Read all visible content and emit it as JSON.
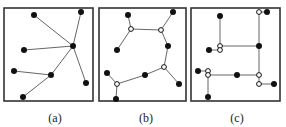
{
  "colors": {
    "stroke": "#555555",
    "border": "#333333",
    "node": "#111111",
    "background": "#ffffff"
  },
  "panels": [
    {
      "id": "a",
      "label": "(a)",
      "label_x": 55,
      "box": {
        "x": 4,
        "y": 8,
        "w": 89,
        "h": 93
      },
      "nodes": [
        {
          "x": 34,
          "y": 15,
          "type": "filled"
        },
        {
          "x": 81,
          "y": 12,
          "type": "filled"
        },
        {
          "x": 73,
          "y": 46,
          "type": "filled"
        },
        {
          "x": 24,
          "y": 50,
          "type": "filled"
        },
        {
          "x": 14,
          "y": 71,
          "type": "filled"
        },
        {
          "x": 51,
          "y": 75,
          "type": "filled"
        },
        {
          "x": 86,
          "y": 83,
          "type": "filled"
        },
        {
          "x": 23,
          "y": 97,
          "type": "filled"
        }
      ],
      "edges": [
        [
          0,
          2
        ],
        [
          1,
          2
        ],
        [
          3,
          2
        ],
        [
          5,
          2
        ],
        [
          6,
          2
        ],
        [
          4,
          5
        ],
        [
          7,
          5
        ]
      ]
    },
    {
      "id": "b",
      "label": "(b)",
      "label_x": 146,
      "box": {
        "x": 99,
        "y": 8,
        "w": 87,
        "h": 93
      },
      "nodes": [
        {
          "x": 128,
          "y": 15,
          "type": "filled"
        },
        {
          "x": 173,
          "y": 12,
          "type": "filled"
        },
        {
          "x": 131,
          "y": 29,
          "type": "open"
        },
        {
          "x": 161,
          "y": 30,
          "type": "open"
        },
        {
          "x": 117,
          "y": 50,
          "type": "filled"
        },
        {
          "x": 168,
          "y": 46,
          "type": "filled"
        },
        {
          "x": 164,
          "y": 67,
          "type": "open"
        },
        {
          "x": 145,
          "y": 75,
          "type": "filled"
        },
        {
          "x": 107,
          "y": 73,
          "type": "filled"
        },
        {
          "x": 117,
          "y": 84,
          "type": "open"
        },
        {
          "x": 179,
          "y": 84,
          "type": "filled"
        },
        {
          "x": 116,
          "y": 99,
          "type": "filled"
        }
      ],
      "edges": [
        [
          0,
          2
        ],
        [
          2,
          3
        ],
        [
          1,
          3
        ],
        [
          2,
          4
        ],
        [
          3,
          5
        ],
        [
          5,
          6
        ],
        [
          6,
          7
        ],
        [
          7,
          9
        ],
        [
          8,
          9
        ],
        [
          9,
          11
        ],
        [
          6,
          10
        ]
      ]
    },
    {
      "id": "c",
      "label": "(c)",
      "label_x": 237,
      "box": {
        "x": 191,
        "y": 8,
        "w": 89,
        "h": 93
      },
      "nodes": [
        {
          "x": 220,
          "y": 16,
          "type": "filled"
        },
        {
          "x": 259,
          "y": 12,
          "type": "open"
        },
        {
          "x": 267,
          "y": 12,
          "type": "filled"
        },
        {
          "x": 220,
          "y": 46,
          "type": "open"
        },
        {
          "x": 220,
          "y": 50,
          "type": "open"
        },
        {
          "x": 209,
          "y": 50,
          "type": "filled"
        },
        {
          "x": 259,
          "y": 46,
          "type": "filled"
        },
        {
          "x": 198,
          "y": 71,
          "type": "filled"
        },
        {
          "x": 208,
          "y": 71,
          "type": "open"
        },
        {
          "x": 208,
          "y": 75,
          "type": "open"
        },
        {
          "x": 237,
          "y": 75,
          "type": "filled"
        },
        {
          "x": 259,
          "y": 75,
          "type": "open"
        },
        {
          "x": 259,
          "y": 84,
          "type": "open"
        },
        {
          "x": 274,
          "y": 84,
          "type": "filled"
        },
        {
          "x": 208,
          "y": 97,
          "type": "filled"
        }
      ],
      "edges": [
        [
          0,
          3
        ],
        [
          3,
          6
        ],
        [
          1,
          2
        ],
        [
          1,
          6
        ],
        [
          6,
          11
        ],
        [
          11,
          12
        ],
        [
          12,
          13
        ],
        [
          5,
          4
        ],
        [
          7,
          8
        ],
        [
          9,
          10
        ],
        [
          10,
          11
        ],
        [
          9,
          14
        ]
      ]
    }
  ]
}
